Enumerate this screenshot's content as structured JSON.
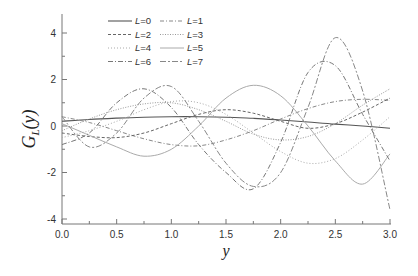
{
  "chart_data": {
    "type": "line",
    "title": "",
    "xlabel": "y",
    "ylabel": "G_L(y)",
    "xlim": [
      0,
      3
    ],
    "ylim": [
      -4.2,
      4.8
    ],
    "xticks": [
      "0.0",
      "0.5",
      "1.0",
      "1.5",
      "2.0",
      "2.5",
      "3.0"
    ],
    "yticks": [
      "-4",
      "-2",
      "0",
      "2",
      "4"
    ],
    "grid": false,
    "legend_position": "upper-left-inside",
    "x": [
      0,
      0.25,
      0.5,
      0.75,
      1.0,
      1.25,
      1.5,
      1.75,
      2.0,
      2.25,
      2.5,
      2.75,
      3.0
    ],
    "series": [
      {
        "name": "L=0",
        "style": "solid",
        "values": [
          0.2,
          0.28,
          0.34,
          0.38,
          0.4,
          0.4,
          0.38,
          0.33,
          0.26,
          0.17,
          0.08,
          0.0,
          -0.1
        ]
      },
      {
        "name": "L=1",
        "style": "dashdot",
        "values": [
          0.4,
          0.15,
          -0.2,
          -0.55,
          -0.8,
          -0.85,
          -0.6,
          -0.2,
          0.3,
          0.75,
          1.05,
          1.15,
          1.1
        ]
      },
      {
        "name": "L=2",
        "style": "dashed",
        "values": [
          -0.3,
          -0.45,
          -0.5,
          -0.3,
          0.1,
          0.5,
          0.7,
          0.55,
          0.2,
          -0.1,
          0.1,
          0.6,
          1.2
        ]
      },
      {
        "name": "L=3",
        "style": "dotted",
        "values": [
          -0.2,
          0.3,
          0.7,
          0.95,
          1.0,
          0.7,
          0.2,
          -0.35,
          -0.6,
          -0.45,
          0.1,
          0.9,
          1.6
        ]
      },
      {
        "name": "L=4",
        "style": "dotted-fine",
        "values": [
          -0.5,
          -0.2,
          0.2,
          0.7,
          1.05,
          1.0,
          0.5,
          -0.3,
          -1.1,
          -1.6,
          -1.4,
          -0.6,
          0.4
        ]
      },
      {
        "name": "L=5",
        "style": "solid-light",
        "values": [
          0.1,
          -0.4,
          -0.9,
          -1.3,
          -1.0,
          0.0,
          1.2,
          1.75,
          1.3,
          0.0,
          -1.5,
          -2.5,
          -1.2
        ]
      },
      {
        "name": "L=6",
        "style": "dashdot-long",
        "values": [
          -0.8,
          -0.3,
          1.0,
          1.6,
          0.8,
          -0.8,
          -2.0,
          -2.7,
          -0.7,
          2.3,
          2.6,
          0.5,
          -1.5
        ]
      },
      {
        "name": "L=7",
        "style": "dashed-long",
        "values": [
          0.4,
          -0.9,
          -0.3,
          1.2,
          1.7,
          0.2,
          -1.6,
          -2.6,
          -2.0,
          0.8,
          3.8,
          1.5,
          -3.6
        ]
      }
    ]
  },
  "legend": {
    "items": [
      {
        "label_prefix": "L",
        "label_suffix": "=0"
      },
      {
        "label_prefix": "L",
        "label_suffix": "=1"
      },
      {
        "label_prefix": "L",
        "label_suffix": "=2"
      },
      {
        "label_prefix": "L",
        "label_suffix": "=3"
      },
      {
        "label_prefix": "L",
        "label_suffix": "=4"
      },
      {
        "label_prefix": "L",
        "label_suffix": "=5"
      },
      {
        "label_prefix": "L",
        "label_suffix": "=6"
      },
      {
        "label_prefix": "L",
        "label_suffix": "=7"
      }
    ]
  },
  "axes": {
    "xlabel": "y",
    "ylabel_main": "G",
    "ylabel_sub": "L",
    "ylabel_arg": "(y)"
  }
}
